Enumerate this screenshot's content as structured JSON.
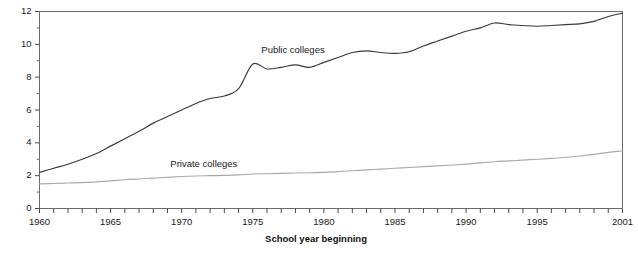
{
  "chart_data": {
    "type": "line",
    "title": "",
    "xlabel": "School year beginning",
    "ylabel": "",
    "xlim": [
      1960,
      2001
    ],
    "ylim": [
      0,
      12
    ],
    "grid": false,
    "legend_position": "inline-annotations",
    "x_tick_labels": [
      "1960",
      "1965",
      "1970",
      "1975",
      "1980",
      "1985",
      "1990",
      "1995",
      "2001"
    ],
    "x_tick_values": [
      1960,
      1965,
      1970,
      1975,
      1980,
      1985,
      1990,
      1995,
      2001
    ],
    "x_minor_tick_step": 1,
    "y_tick_labels": [
      "0",
      "2",
      "4",
      "6",
      "8",
      "10",
      "12"
    ],
    "y_tick_values": [
      0,
      2,
      4,
      6,
      8,
      10,
      12
    ],
    "y_minor_tick_values": [
      1,
      3,
      5,
      7,
      9,
      11
    ],
    "x": [
      1960,
      1961,
      1962,
      1963,
      1964,
      1965,
      1966,
      1967,
      1968,
      1969,
      1970,
      1971,
      1972,
      1973,
      1974,
      1975,
      1976,
      1977,
      1978,
      1979,
      1980,
      1981,
      1982,
      1983,
      1984,
      1985,
      1986,
      1987,
      1988,
      1989,
      1990,
      1991,
      1992,
      1993,
      1994,
      1995,
      1996,
      1997,
      1998,
      1999,
      2000,
      2001
    ],
    "series": [
      {
        "name": "Public colleges",
        "color": "#3a3a3a",
        "label_x": 1975.6,
        "label_y": 9.5,
        "values": [
          2.2,
          2.45,
          2.7,
          3.0,
          3.35,
          3.8,
          4.25,
          4.7,
          5.2,
          5.6,
          6.0,
          6.4,
          6.7,
          6.85,
          7.3,
          8.8,
          8.5,
          8.6,
          8.75,
          8.6,
          8.9,
          9.2,
          9.5,
          9.6,
          9.5,
          9.45,
          9.55,
          9.9,
          10.2,
          10.5,
          10.8,
          11.0,
          11.3,
          11.2,
          11.15,
          11.1,
          11.15,
          11.2,
          11.25,
          11.4,
          11.7,
          11.9
        ]
      },
      {
        "name": "Private colleges",
        "color": "#a9a9a9",
        "label_x": 1969.2,
        "label_y": 2.55,
        "values": [
          1.5,
          1.52,
          1.55,
          1.58,
          1.62,
          1.68,
          1.75,
          1.8,
          1.85,
          1.9,
          1.95,
          1.98,
          2.0,
          2.02,
          2.05,
          2.1,
          2.12,
          2.14,
          2.16,
          2.18,
          2.2,
          2.25,
          2.3,
          2.35,
          2.4,
          2.45,
          2.5,
          2.55,
          2.6,
          2.65,
          2.7,
          2.78,
          2.85,
          2.9,
          2.95,
          3.0,
          3.05,
          3.12,
          3.2,
          3.3,
          3.42,
          3.52
        ]
      }
    ]
  },
  "axis_title": "School year beginning"
}
